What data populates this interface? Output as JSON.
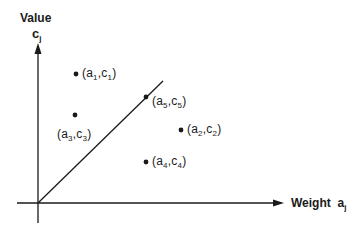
{
  "diagram": {
    "y_axis": {
      "title": "Value",
      "symbol": "c",
      "subscript": "j"
    },
    "x_axis": {
      "title": "Weight",
      "symbol": "a",
      "subscript": "j"
    },
    "points": [
      {
        "id": "p1",
        "a": "a",
        "a_sub": "1",
        "c": "c",
        "c_sub": "1"
      },
      {
        "id": "p2",
        "a": "a",
        "a_sub": "2",
        "c": "c",
        "c_sub": "2"
      },
      {
        "id": "p3",
        "a": "a",
        "a_sub": "3",
        "c": "c",
        "c_sub": "3"
      },
      {
        "id": "p4",
        "a": "a",
        "a_sub": "4",
        "c": "c",
        "c_sub": "4"
      },
      {
        "id": "p5",
        "a": "a",
        "a_sub": "5",
        "c": "c",
        "c_sub": "5"
      }
    ],
    "line": {
      "from": "origin",
      "through": "(a5,c5)"
    },
    "colors": {
      "ink": "#1a1a1a",
      "background": "#ffffff"
    }
  }
}
